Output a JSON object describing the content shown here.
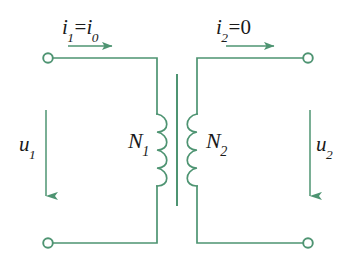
{
  "figure": {
    "kind": "transformer-circuit-diagram",
    "background_color": "#ffffff",
    "wire_color": "#4e9472",
    "text_color": "#1a1a1a"
  },
  "labels": {
    "current_primary": {
      "symbol": "i",
      "subscript": "1",
      "operator": "=",
      "value_symbol": "i",
      "value_subscript": "0",
      "text": "i1=i0"
    },
    "current_secondary": {
      "symbol": "i",
      "subscript": "2",
      "operator": "=",
      "value_symbol": "0",
      "value_subscript": "",
      "text": "i2=0"
    },
    "voltage_primary": {
      "symbol": "u",
      "subscript": "1",
      "text": "u1"
    },
    "voltage_secondary": {
      "symbol": "u",
      "subscript": "2",
      "text": "u2"
    },
    "turns_primary": {
      "symbol": "N",
      "subscript": "1",
      "text": "N1"
    },
    "turns_secondary": {
      "symbol": "N",
      "subscript": "2",
      "text": "N2"
    }
  },
  "elements": {
    "terminal_top_left": {
      "name": "terminal-top-left",
      "x": 48,
      "y": 58,
      "radius": 5,
      "filled": false
    },
    "terminal_bottom_left": {
      "name": "terminal-bottom-left",
      "x": 48,
      "y": 243,
      "radius": 5,
      "filled": false
    },
    "terminal_top_right": {
      "name": "terminal-top-right",
      "x": 308,
      "y": 58,
      "radius": 5,
      "filled": false
    },
    "terminal_bottom_right": {
      "name": "terminal-bottom-right",
      "x": 308,
      "y": 243,
      "radius": 5,
      "filled": false
    },
    "core_line": {
      "name": "transformer-core",
      "x": 177,
      "y_top": 75,
      "y_bottom": 205
    },
    "coil_primary": {
      "name": "primary-winding",
      "x": 157,
      "y_top": 114,
      "y_bottom": 186,
      "turns": 4,
      "bulge_direction": "right"
    },
    "coil_secondary": {
      "name": "secondary-winding",
      "x": 197,
      "y_top": 114,
      "y_bottom": 186,
      "turns": 4,
      "bulge_direction": "left"
    },
    "arrow_current_primary": {
      "name": "primary-current-arrow",
      "x_start": 68,
      "x_end": 116,
      "y": 46,
      "direction": "right"
    },
    "arrow_current_secondary": {
      "name": "secondary-current-arrow",
      "x_start": 226,
      "x_end": 278,
      "y": 46,
      "direction": "right"
    },
    "arrow_voltage_primary": {
      "name": "primary-voltage-arrow",
      "x": 46,
      "y_start": 110,
      "y_end": 200,
      "direction": "down"
    },
    "arrow_voltage_secondary": {
      "name": "secondary-voltage-arrow",
      "x": 310,
      "y_start": 110,
      "y_end": 200,
      "direction": "down"
    }
  }
}
